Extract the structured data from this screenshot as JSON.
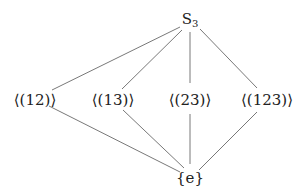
{
  "nodes": {
    "top": {
      "base": "S",
      "sub": "3"
    },
    "n12": "⟨(12)⟩",
    "n13": "⟨(13)⟩",
    "n23": "⟨(23)⟩",
    "n123": "⟨(123)⟩",
    "bottom": "{e}"
  },
  "edges": [
    [
      "S3",
      "⟨(12)⟩"
    ],
    [
      "S3",
      "⟨(13)⟩"
    ],
    [
      "S3",
      "⟨(23)⟩"
    ],
    [
      "S3",
      "⟨(123)⟩"
    ],
    [
      "⟨(12)⟩",
      "{e}"
    ],
    [
      "⟨(13)⟩",
      "{e}"
    ],
    [
      "⟨(23)⟩",
      "{e}"
    ],
    [
      "⟨(123)⟩",
      "{e}"
    ]
  ],
  "colors": {
    "line": "#555555",
    "text": "#222222"
  }
}
